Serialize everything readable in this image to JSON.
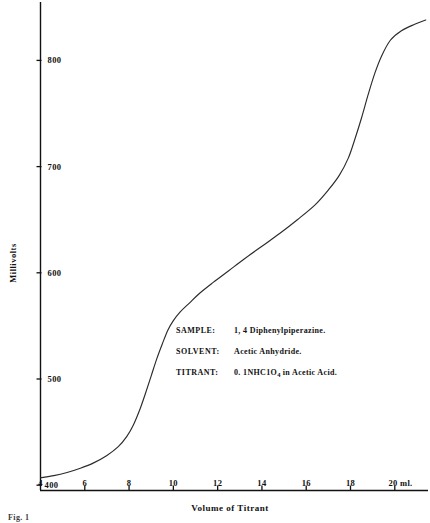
{
  "figure": {
    "caption": "Fig. 1"
  },
  "axes": {
    "y_title": "Millivolts",
    "x_title": "Volume of Titrant",
    "y_ticks": [
      {
        "label": "800",
        "value": 800
      },
      {
        "label": "700",
        "value": 700
      },
      {
        "label": "600",
        "value": 600
      },
      {
        "label": "500",
        "value": 500
      },
      {
        "label": "400",
        "value": 400
      }
    ],
    "x_ticks": [
      {
        "label": "4",
        "value": 4
      },
      {
        "label": "6",
        "value": 6
      },
      {
        "label": "8",
        "value": 8
      },
      {
        "label": "10",
        "value": 10
      },
      {
        "label": "12",
        "value": 12
      },
      {
        "label": "14",
        "value": 14
      },
      {
        "label": "16",
        "value": 16
      },
      {
        "label": "18",
        "value": 18
      },
      {
        "label": "20 ml.",
        "value": 20
      }
    ]
  },
  "annotation": {
    "rows": [
      {
        "key": "SAMPLE:",
        "value": "1, 4 Diphenylpiperazine."
      },
      {
        "key": "SOLVENT:",
        "value": "Acetic Anhydride."
      },
      {
        "key": "TITRANT:",
        "value_prefix": "0. 1NHC1O",
        "value_sub": "4",
        "value_suffix": " in Acetic Acid."
      }
    ]
  },
  "chart_data": {
    "type": "line",
    "title": "",
    "xlabel": "Volume of Titrant",
    "ylabel": "Millivolts",
    "xlim": [
      4,
      21.5
    ],
    "ylim": [
      395,
      855
    ],
    "grid": false,
    "legend": "none",
    "x_unit": "ml",
    "y_unit": "millivolts",
    "series": [
      {
        "name": "Potentiometric titration of 1,4 Diphenylpiperazine",
        "x": [
          4.0,
          4.6,
          5.2,
          5.8,
          6.4,
          7.0,
          7.5,
          7.9,
          8.2,
          8.5,
          8.75,
          9.0,
          9.25,
          9.5,
          9.75,
          10.0,
          10.3,
          10.7,
          11.2,
          11.8,
          12.5,
          13.2,
          14.0,
          14.8,
          15.6,
          16.4,
          17.0,
          17.5,
          17.9,
          18.2,
          18.5,
          18.8,
          19.1,
          19.4,
          19.8,
          20.3,
          20.9,
          21.4
        ],
        "y": [
          407,
          409,
          412,
          416,
          421,
          428,
          436,
          446,
          457,
          472,
          487,
          503,
          519,
          533,
          546,
          555,
          563,
          571,
          581,
          591,
          602,
          613,
          625,
          637,
          650,
          664,
          678,
          692,
          708,
          726,
          746,
          768,
          788,
          804,
          819,
          828,
          834,
          838
        ]
      }
    ],
    "inflections": [
      {
        "x": 9.0,
        "y": 503,
        "note": "first equivalence-point break"
      },
      {
        "x": 18.6,
        "y": 752,
        "note": "second equivalence-point break"
      }
    ]
  },
  "colors": {
    "axis": "#111111",
    "curve": "#2b2b2b",
    "background": "#ffffff",
    "text": "#111111"
  }
}
